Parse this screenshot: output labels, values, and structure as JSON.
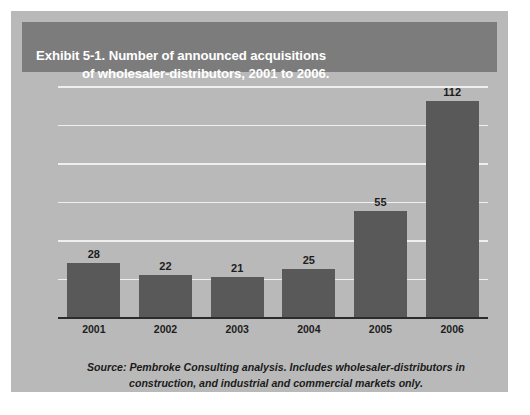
{
  "exhibit": {
    "title_line1": "Exhibit 5-1. Number of announced acquisitions",
    "title_line2": "of wholesaler-distributors, 2001 to 2006.",
    "source_line1": "Source: Pembroke Consulting analysis. Includes wholesaler-distributors in",
    "source_line2": "construction, and industrial and commercial markets only."
  },
  "colors": {
    "card_background": "#b9b9b9",
    "header_band": "#7c7c7c",
    "header_text": "#ffffff",
    "bar_fill": "#595959",
    "gridline": "#efefef",
    "axis_line": "#2b2b2b",
    "label_text": "#1d1d1d"
  },
  "chart_data": {
    "type": "bar",
    "title": "Exhibit 5-1. Number of announced acquisitions of wholesaler-distributors, 2001 to 2006.",
    "xlabel": "",
    "ylabel": "",
    "categories": [
      "2001",
      "2002",
      "2003",
      "2004",
      "2005",
      "2006"
    ],
    "values": [
      28,
      22,
      21,
      25,
      55,
      112
    ],
    "data_labels": [
      "28",
      "22",
      "21",
      "25",
      "55",
      "112"
    ],
    "ylim": [
      0,
      120
    ],
    "gridlines": [
      20,
      40,
      60,
      80,
      100,
      120
    ],
    "grid": true,
    "legend": "none",
    "annotations": [
      "Source: Pembroke Consulting analysis. Includes wholesaler-distributors in construction, and industrial and commercial markets only."
    ]
  }
}
